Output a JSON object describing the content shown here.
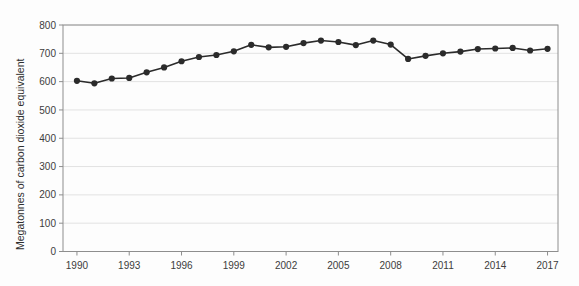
{
  "chart_data": {
    "type": "line",
    "title": "",
    "xlabel": "",
    "ylabel": "Megatonnes of carbon dioxide equivalent",
    "xlim": [
      1989.2,
      2017.6
    ],
    "ylim": [
      0,
      800
    ],
    "grid": true,
    "legend": "none",
    "series_color": "#2b2b2b",
    "marker": "circle",
    "x": [
      1990,
      1991,
      1992,
      1993,
      1994,
      1995,
      1996,
      1997,
      1998,
      1999,
      2000,
      2001,
      2002,
      2003,
      2004,
      2005,
      2006,
      2007,
      2008,
      2009,
      2010,
      2011,
      2012,
      2013,
      2014,
      2015,
      2016,
      2017
    ],
    "y": [
      603,
      594,
      611,
      613,
      633,
      650,
      672,
      687,
      694,
      707,
      730,
      721,
      723,
      736,
      745,
      740,
      729,
      745,
      731,
      680,
      691,
      700,
      706,
      715,
      717,
      719,
      710,
      716
    ],
    "xticks": [
      1990,
      1993,
      1996,
      1999,
      2002,
      2005,
      2008,
      2011,
      2014,
      2017
    ],
    "xticklabels": [
      "1990",
      "1993",
      "1996",
      "1999",
      "2002",
      "2005",
      "2008",
      "2011",
      "2014",
      "2017"
    ],
    "yticks": [
      0,
      100,
      200,
      300,
      400,
      500,
      600,
      700,
      800
    ],
    "yticklabels": [
      "0",
      "100",
      "200",
      "300",
      "400",
      "500",
      "600",
      "700",
      "800"
    ]
  }
}
